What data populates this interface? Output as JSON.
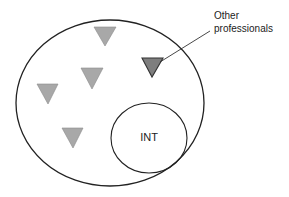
{
  "diagram": {
    "outer_group": {
      "cx": 110,
      "cy": 103,
      "rx": 94,
      "ry": 83,
      "stroke": "#222222"
    },
    "inner_group": {
      "label": "INT",
      "cx": 149,
      "cy": 138,
      "rx": 38,
      "ry": 35,
      "stroke": "#222222"
    },
    "members": [
      {
        "id": "t1",
        "points": "94,27 116,27 105,46",
        "fill": "#a8a8a8",
        "highlighted": false
      },
      {
        "id": "t2",
        "points": "81,68 103,68 92,89",
        "fill": "#a8a8a8",
        "highlighted": false
      },
      {
        "id": "t3",
        "points": "37,84 58,84 48,104",
        "fill": "#a8a8a8",
        "highlighted": false
      },
      {
        "id": "t4",
        "points": "62,128 83,128 73,148",
        "fill": "#a8a8a8",
        "highlighted": false
      },
      {
        "id": "t5",
        "points": "142,58 163,58 152,77",
        "fill": "#7e7e7e",
        "highlighted": true
      }
    ],
    "callout": {
      "line1": "Other",
      "line2": "professionals",
      "leader": {
        "x1": 210,
        "y1": 31,
        "x2": 160,
        "y2": 62
      }
    }
  }
}
